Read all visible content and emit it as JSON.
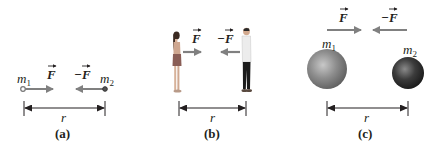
{
  "figure": {
    "panels": [
      {
        "id": "a",
        "caption": "(a)",
        "mass1_label": "m",
        "mass1_sub": "1",
        "mass2_label": "m",
        "mass2_sub": "2",
        "force_label": "F",
        "neg_force_label": "−F",
        "distance_label": "r",
        "objects": "point masses"
      },
      {
        "id": "b",
        "caption": "(b)",
        "force_label": "F",
        "neg_force_label": "−F",
        "distance_label": "r",
        "objects": "woman and man standing"
      },
      {
        "id": "c",
        "caption": "(c)",
        "mass1_label": "m",
        "mass1_sub": "1",
        "mass2_label": "m",
        "mass2_sub": "2",
        "force_label": "F",
        "neg_force_label": "−F",
        "distance_label": "r",
        "objects": "spheres"
      }
    ],
    "colors": {
      "arrow_gray": "#808080",
      "dimension_line": "#231f20",
      "sphere1": "#8a8a8a",
      "sphere2": "#3a3a3a"
    }
  }
}
